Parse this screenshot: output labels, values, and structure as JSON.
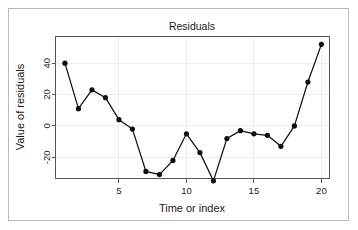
{
  "chart_data": {
    "type": "line",
    "title": "Residuals",
    "xlabel": "Time or index",
    "ylabel": "Value of residuals",
    "x": [
      1,
      2,
      3,
      4,
      5,
      6,
      7,
      8,
      9,
      10,
      11,
      12,
      13,
      14,
      15,
      16,
      17,
      18,
      19,
      20
    ],
    "values": [
      40,
      11,
      23,
      18,
      4,
      -2,
      -29,
      -31,
      -22,
      -5,
      -17,
      -35,
      -8,
      -3,
      -5,
      -6,
      -13,
      0,
      28,
      52
    ],
    "series": [
      {
        "name": "residuals",
        "values": [
          40,
          11,
          23,
          18,
          4,
          -2,
          -29,
          -31,
          -22,
          -5,
          -17,
          -35,
          -8,
          -3,
          -5,
          -6,
          -13,
          0,
          28,
          52
        ]
      }
    ],
    "xticks": [
      5,
      10,
      15,
      20
    ],
    "xtick_labels": [
      "5",
      "10",
      "15",
      "20"
    ],
    "yticks": [
      -20,
      0,
      20,
      40
    ],
    "ytick_labels": [
      "-20",
      "0",
      "20",
      "40"
    ],
    "xlim": [
      0.3,
      20.6
    ],
    "ylim": [
      -33.5,
      57.0
    ],
    "grid": true,
    "legend": null,
    "marker": "filled-circle",
    "line_color": "#111111",
    "marker_color": "#0d0d0d",
    "grid_color": "#eeeeee",
    "axis_color": "#555555",
    "background_color": "#ffffff",
    "frame_color": "#b9b9b9"
  }
}
